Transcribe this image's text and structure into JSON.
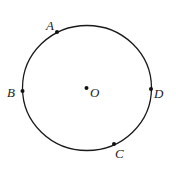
{
  "diagram": {
    "circle": {
      "cx": 87,
      "cy": 88,
      "rx": 64.5,
      "ry": 62.5,
      "stroke": "#1a1a1a"
    },
    "points": [
      {
        "name": "A",
        "x": 57,
        "y": 32,
        "label_x": 46,
        "label_y": 30
      },
      {
        "name": "B",
        "x": 22.5,
        "y": 91,
        "label_x": 7,
        "label_y": 97
      },
      {
        "name": "O",
        "x": 86.5,
        "y": 88,
        "label_x": 90,
        "label_y": 97
      },
      {
        "name": "D",
        "x": 151,
        "y": 89,
        "label_x": 154,
        "label_y": 98
      },
      {
        "name": "C",
        "x": 114,
        "y": 144,
        "label_x": 115,
        "label_y": 158
      }
    ]
  }
}
